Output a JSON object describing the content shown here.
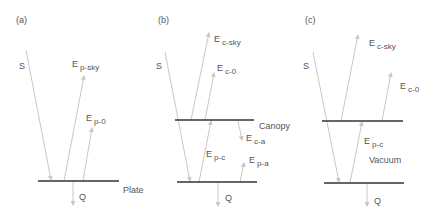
{
  "panels": [
    {
      "tag": "(a)",
      "labels": {
        "S": "S",
        "E1": "E",
        "E1_sub": "p-sky",
        "E2": "E",
        "E2_sub": "p-0",
        "Q": "Q",
        "surface": "Plate"
      }
    },
    {
      "tag": "(b)",
      "labels": {
        "S": "S",
        "E1": "E",
        "E1_sub": "c-sky",
        "E2": "E",
        "E2_sub": "c-0",
        "E3": "E",
        "E3_sub": "p-c",
        "E4": "E",
        "E4_sub": "c-a",
        "E5": "E",
        "E5_sub": "p-a",
        "Q": "Q",
        "surface": "Canopy"
      }
    },
    {
      "tag": "(c)",
      "labels": {
        "S": "S",
        "E1": "E",
        "E1_sub": "c-sky",
        "E2": "E",
        "E2_sub": "c-0",
        "E3": "E",
        "E3_sub": "p-c",
        "Q": "Q",
        "gap": "Vacuum"
      }
    }
  ],
  "colors": {
    "line": "#c8c8c8",
    "surface": "#333333",
    "text": "#555555"
  }
}
